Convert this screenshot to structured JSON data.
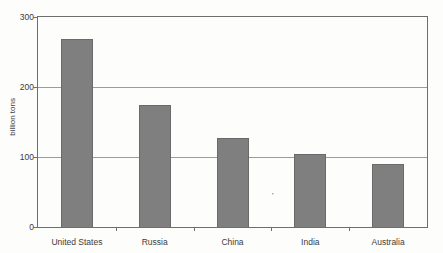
{
  "chart_data": {
    "type": "bar",
    "title": "",
    "categories": [
      "United States",
      "Russia",
      "China",
      "India",
      "Australia"
    ],
    "values": [
      268,
      174,
      127,
      104,
      90
    ],
    "xlabel": "",
    "ylabel": "billion tons",
    "ylim": [
      0,
      300
    ],
    "yticks": [
      0,
      100,
      200,
      300
    ],
    "inner_gridlines": [
      100,
      200
    ],
    "legend": "none",
    "grid": "horizontal",
    "bar_color": "#7f7f7f",
    "bar_border_color": "#6a6a6a",
    "frame_color": "#6e6e6e",
    "background_color": "#fdfdfc",
    "text_color": "#3c3c3c"
  },
  "artifact": {
    "glyph": "'"
  }
}
